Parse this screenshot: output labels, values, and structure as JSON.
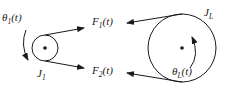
{
  "diagram": {
    "title": "",
    "pulley_small": {
      "inertia_label": "J",
      "inertia_sub": "1",
      "angle_label_prefix": "θ",
      "angle_label_sub": "1",
      "angle_label_suffix": "(t)"
    },
    "pulley_large": {
      "inertia_label": "J",
      "inertia_sub": "L",
      "angle_label_prefix": "θ",
      "angle_label_sub": "L",
      "angle_label_suffix": "(t)"
    },
    "forces": [
      {
        "prefix": "F",
        "sub": "1",
        "suffix": "(t)"
      },
      {
        "prefix": "F",
        "sub": "2",
        "suffix": "(t)"
      }
    ],
    "colors": {
      "stroke": "#1a1a1a",
      "background": "#ffffff"
    }
  }
}
